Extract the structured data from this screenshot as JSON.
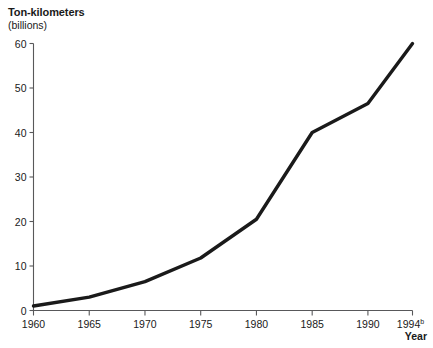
{
  "chart_data": {
    "type": "line",
    "title": "",
    "ylabel": "Ton-kilometers",
    "ylabel_sub": "(billions)",
    "xlabel": "Year",
    "xlim": [
      1960,
      1994
    ],
    "ylim": [
      0,
      60
    ],
    "grid": false,
    "legend": null,
    "x_tick_labels": [
      "1960",
      "1965",
      "1970",
      "1975",
      "1980",
      "1985",
      "1990",
      "1994"
    ],
    "x_tick_superscripts": [
      "",
      "",
      "",
      "",
      "",
      "",
      "",
      "b"
    ],
    "x_ticks": [
      1960,
      1965,
      1970,
      1975,
      1980,
      1985,
      1990,
      1994
    ],
    "y_tick_labels": [
      "0",
      "10",
      "20",
      "30",
      "40",
      "50",
      "60"
    ],
    "y_ticks": [
      0,
      10,
      20,
      30,
      40,
      50,
      60
    ],
    "series": [
      {
        "name": "Ton-kilometers",
        "color": "#1a1a1a",
        "x": [
          1960,
          1965,
          1970,
          1975,
          1980,
          1985,
          1990,
          1994
        ],
        "values": [
          1,
          3,
          6.5,
          11.8,
          20.5,
          40,
          46.5,
          60
        ]
      }
    ]
  }
}
